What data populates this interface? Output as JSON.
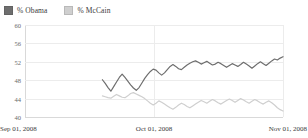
{
  "chart_data": {
    "type": "line",
    "title": "",
    "xlabel": "",
    "ylabel": "",
    "ylim": [
      40,
      60
    ],
    "yticks": [
      60,
      56,
      52,
      48,
      44,
      40
    ],
    "grid": true,
    "legend_position": "top-left",
    "xticks": [
      "Sep 01, 2008",
      "Oct 01, 2008",
      "Nov 01, 2008"
    ],
    "x_start_fraction": 0.3,
    "series": [
      {
        "name": "% Obama",
        "color": "#6e6e6e",
        "values": [
          48.1,
          47.3,
          46.4,
          45.6,
          46.6,
          47.6,
          48.6,
          49.3,
          48.6,
          47.8,
          47.0,
          46.3,
          45.8,
          46.4,
          47.4,
          48.4,
          49.2,
          49.9,
          50.4,
          50.2,
          49.6,
          49.1,
          49.6,
          50.3,
          51.0,
          51.4,
          51.0,
          50.5,
          50.3,
          50.8,
          51.3,
          51.7,
          52.0,
          52.2,
          51.9,
          51.5,
          51.8,
          52.1,
          51.7,
          51.3,
          51.5,
          51.9,
          51.6,
          51.2,
          50.8,
          51.2,
          51.6,
          51.3,
          51.0,
          51.4,
          51.9,
          51.5,
          51.1,
          50.6,
          51.1,
          51.6,
          52.0,
          51.6,
          51.2,
          51.7,
          52.2,
          52.6,
          52.4,
          52.8,
          53.1
        ]
      },
      {
        "name": "% McCain",
        "color": "#cfcfcf",
        "values": [
          44.6,
          44.4,
          44.2,
          44.1,
          44.5,
          44.9,
          44.6,
          44.3,
          44.2,
          44.6,
          45.1,
          45.3,
          45.0,
          44.7,
          44.4,
          44.0,
          43.5,
          43.0,
          42.6,
          43.0,
          43.5,
          43.2,
          42.8,
          42.4,
          42.0,
          41.7,
          42.1,
          42.6,
          43.0,
          42.7,
          42.3,
          42.0,
          42.4,
          42.8,
          43.2,
          43.6,
          43.3,
          43.0,
          43.4,
          43.8,
          43.5,
          43.1,
          42.8,
          43.2,
          43.6,
          43.9,
          43.6,
          43.2,
          43.6,
          44.0,
          43.7,
          43.3,
          43.0,
          43.4,
          43.8,
          43.5,
          43.1,
          42.8,
          43.2,
          43.5,
          43.1,
          42.6,
          42.0,
          41.6,
          41.3
        ]
      }
    ]
  },
  "legend": {
    "items": [
      {
        "label": "% Obama",
        "color": "#6e6e6e"
      },
      {
        "label": "% McCain",
        "color": "#cfcfcf"
      }
    ]
  },
  "axes": {
    "y_labels": [
      "60",
      "56",
      "52",
      "48",
      "44",
      "40"
    ],
    "x_labels": {
      "start": "Sep 01, 2008",
      "mid": "Oct 01, 2008",
      "end": "Nov 01, 2008"
    }
  }
}
